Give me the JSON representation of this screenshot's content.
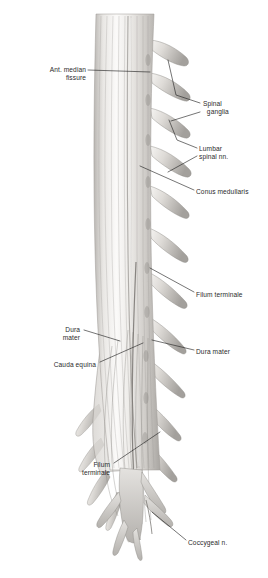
{
  "figure": {
    "background_color": "#ffffff",
    "ink_color": "#2b2b2b",
    "tissue_light": "#f2f1ef",
    "tissue_mid": "#c9c7c4",
    "tissue_dark": "#8e8b88"
  },
  "labels": [
    {
      "id": "ant-median-fissure",
      "text": "Ant. median\nfissure",
      "align": "right",
      "x": 14,
      "y": 66,
      "w": 72
    },
    {
      "id": "spinal-ganglia",
      "text": "Spinal\n  ganglia",
      "align": "left",
      "x": 203,
      "y": 100,
      "w": 60
    },
    {
      "id": "lumbar-spinal-nn",
      "text": "Lumbar\nspinal nn.",
      "align": "left",
      "x": 199,
      "y": 145,
      "w": 62
    },
    {
      "id": "conus-medullaris",
      "text": "Conus medullaris",
      "align": "left",
      "x": 196,
      "y": 188,
      "w": 70
    },
    {
      "id": "filum-terminale-1",
      "text": "Filum terminale",
      "align": "left",
      "x": 196,
      "y": 291,
      "w": 70
    },
    {
      "id": "dura-mater-left",
      "text": "Dura\nmater",
      "align": "right",
      "x": 40,
      "y": 326,
      "w": 40
    },
    {
      "id": "dura-mater-right",
      "text": "Dura mater",
      "align": "left",
      "x": 196,
      "y": 348,
      "w": 62
    },
    {
      "id": "cauda-equina",
      "text": "Cauda equina",
      "align": "right",
      "x": 30,
      "y": 361,
      "w": 66
    },
    {
      "id": "filum-terminale-2",
      "text": "Filum\nterminale",
      "align": "right",
      "x": 62,
      "y": 461,
      "w": 48
    },
    {
      "id": "coccygeal-n",
      "text": "Coccygeal n.",
      "align": "left",
      "x": 188,
      "y": 539,
      "w": 62
    }
  ],
  "leaders": [
    {
      "id": "leader-ant-median-fissure",
      "points": "88,70 150,72"
    },
    {
      "id": "leader-spinal-ganglia-a",
      "points": "200,103 176,95 168,60"
    },
    {
      "id": "leader-spinal-ganglia-b",
      "points": "200,112 171,121"
    },
    {
      "id": "leader-lumbar-a",
      "points": "197,148 177,140 169,120"
    },
    {
      "id": "leader-lumbar-b",
      "points": "197,156 168,172"
    },
    {
      "id": "leader-conus",
      "points": "194,190 140,166"
    },
    {
      "id": "leader-filum-1",
      "points": "194,292 150,268"
    },
    {
      "id": "leader-dura-left",
      "points": "84,330 120,341"
    },
    {
      "id": "leader-dura-right",
      "points": "194,350 152,340"
    },
    {
      "id": "leader-cauda-equina",
      "points": "100,362 143,343"
    },
    {
      "id": "leader-filum-2",
      "points": "114,463 160,432"
    },
    {
      "id": "leader-coccygeal",
      "points": "186,540 152,512"
    }
  ],
  "structures": {
    "cord_label": "spinal-cord-shaft",
    "dura_flap_label": "dura-mater-flap",
    "right_roots_count": 11,
    "left_roots_count": 5,
    "terminal_roots_count": 6
  }
}
